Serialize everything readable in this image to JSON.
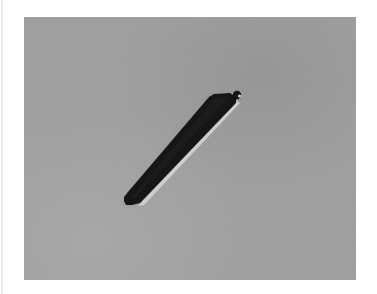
{
  "image": {
    "description": "Grayscale micrograph of an elongated dark rod-shaped object with a small knob at its upper-right end, on a uniform grey background",
    "colors": {
      "page_background": "#ffffff",
      "photo_background": "#a3a3a3",
      "photo_background_dark": "#989898",
      "photo_background_light": "#adadad",
      "object_fill": "#141414",
      "object_highlight": "#d6d6d6",
      "edge_line": "#ececec"
    }
  }
}
